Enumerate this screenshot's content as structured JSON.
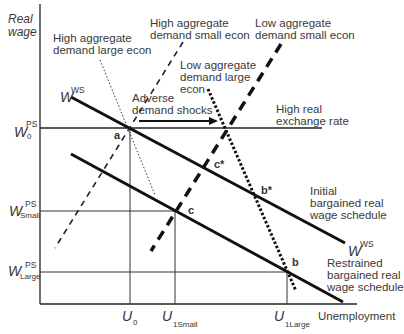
{
  "axes": {
    "y_label_line1": "Real",
    "y_label_line2": "wage",
    "x_label": "Unemployment"
  },
  "y_ticks": [
    {
      "symbol": "W",
      "sup": "PS",
      "sub": "0"
    },
    {
      "symbol": "W",
      "sup": "PS",
      "sub": "Small"
    },
    {
      "symbol": "W",
      "sup": "PS",
      "sub": "Large"
    }
  ],
  "x_ticks": [
    {
      "symbol": "U",
      "sub": "0"
    },
    {
      "symbol": "U",
      "sub": "1Small"
    },
    {
      "symbol": "U",
      "sub": "1Large"
    }
  ],
  "curves": {
    "ws_upper": {
      "symbol": "W",
      "sup": "WS"
    },
    "ws_lower_end": {
      "symbol": "W",
      "sup": "WS"
    },
    "high_ad_large": {
      "line1": "High aggregate",
      "line2": "demand large econ"
    },
    "high_ad_small": {
      "line1": "High aggregate",
      "line2": "demand small econ"
    },
    "low_ad_small": {
      "line1": "Low aggregate",
      "line2": "demand small econ"
    },
    "low_ad_large": {
      "line1": "Low aggregate",
      "line2": "demand large",
      "line3": "econ"
    }
  },
  "annotations": {
    "adverse_line1": "Adverse",
    "adverse_line2": "demand shocks",
    "high_rer_line1": "High real",
    "high_rer_line2": "exchange rate",
    "initial_line1": "Initial",
    "initial_line2": "bargained real",
    "initial_line3": "wage schedule",
    "restrained_line1": "Restrained",
    "restrained_line2": "bargained real",
    "restrained_line3": "wage schedule"
  },
  "points": {
    "a": "a",
    "b": "b",
    "b_star": "b*",
    "c": "c",
    "c_star": "c*"
  }
}
